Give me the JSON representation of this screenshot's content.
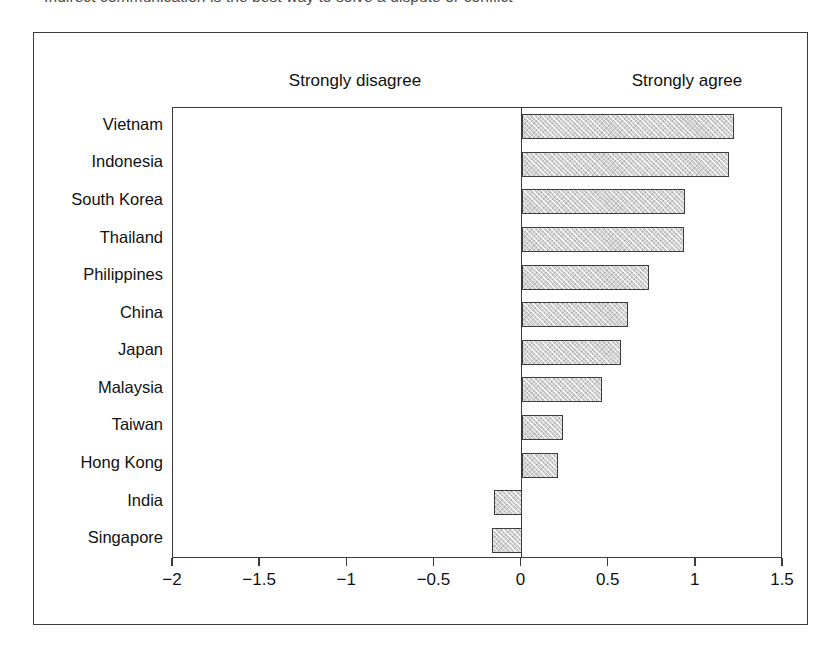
{
  "caption": {
    "text": "Indirect communication is the best way to solve a dispute or conflict"
  },
  "chart_data": {
    "type": "bar",
    "orientation": "horizontal",
    "title": "Indirect communication is the best way to solve a dispute or conflict",
    "xlabel": "",
    "ylabel": "",
    "xlim": [
      -2,
      1.5
    ],
    "grid": false,
    "legend": null,
    "zero_reference_line": 0,
    "pole_labels": {
      "left": "Strongly disagree",
      "right": "Strongly agree"
    },
    "xticks": [
      -2,
      -1.5,
      -1,
      -0.5,
      0,
      0.5,
      1,
      1.5
    ],
    "xticklabels": [
      "−2",
      "−1.5",
      "−1",
      "−0.5",
      "0",
      "0.5",
      "1",
      "1.5"
    ],
    "categories": [
      "Vietnam",
      "Indonesia",
      "South Korea",
      "Thailand",
      "Philippines",
      "China",
      "Japan",
      "Malaysia",
      "Taiwan",
      "Hong Kong",
      "India",
      "Singapore"
    ],
    "values": [
      1.22,
      1.19,
      0.94,
      0.93,
      0.73,
      0.61,
      0.57,
      0.46,
      0.24,
      0.21,
      -0.16,
      -0.17
    ],
    "bar_style": {
      "fill": "#d2d2d2",
      "pattern": "cross-hatch",
      "edge": "#3d3d3d"
    }
  },
  "frame": {
    "border_color": "#3b3b3b"
  }
}
